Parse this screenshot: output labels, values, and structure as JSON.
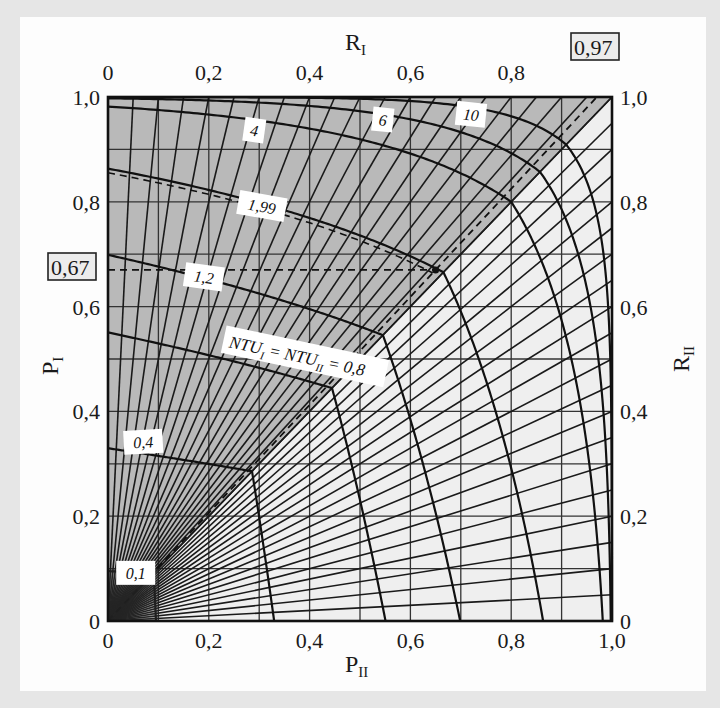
{
  "chart_data": {
    "type": "line",
    "title": "",
    "plot_kind": "P-NTU-R diagram (counterflow), symmetric representation",
    "xlabel": "P_II",
    "ylabel": "P_I",
    "top_xlabel": "R_I",
    "right_ylabel": "R_II",
    "xlim": [
      0,
      1.0
    ],
    "ylim": [
      0,
      1.0
    ],
    "grid": true,
    "grid_step": 0.1,
    "x_ticks": [
      "0",
      "0,2",
      "0,4",
      "0,6",
      "0,8",
      "1,0"
    ],
    "y_ticks": [
      "0",
      "0,2",
      "0,4",
      "0,6",
      "0,8",
      "1,0"
    ],
    "top_ticks": [
      "0",
      "0,2",
      "0,4",
      "0,6",
      "0,8"
    ],
    "right_ticks": [
      "0",
      "0,2",
      "0,4",
      "0,6",
      "0,8",
      "1,0"
    ],
    "highlighted_values": {
      "R_I": "0,97",
      "P_I": "0,67"
    },
    "R_lines": [
      0,
      0.05,
      0.1,
      0.15,
      0.2,
      0.25,
      0.3,
      0.35,
      0.4,
      0.45,
      0.5,
      0.55,
      0.6,
      0.65,
      0.7,
      0.75,
      0.8,
      0.85,
      0.9,
      0.95,
      1.0
    ],
    "ntu_curves": [
      0.1,
      0.4,
      0.8,
      1.2,
      1.99,
      4,
      6,
      10
    ],
    "ntu_labels": [
      {
        "ntu": 0.1,
        "text": "0,1",
        "x": 0.055,
        "y": 0.09,
        "rot": 0
      },
      {
        "ntu": 0.4,
        "text": "0,4",
        "x": 0.07,
        "y": 0.34,
        "rot": -3
      },
      {
        "ntu": 0.8,
        "text": "NTU_I = NTU_II = 0,8",
        "x": 0.24,
        "y": 0.53,
        "rot": 12
      },
      {
        "ntu": 1.2,
        "text": "1,2",
        "x": 0.19,
        "y": 0.655,
        "rot": 8
      },
      {
        "ntu": 1.99,
        "text": "1,99",
        "x": 0.305,
        "y": 0.79,
        "rot": 10
      },
      {
        "ntu": 4,
        "text": "4",
        "x": 0.29,
        "y": 0.935,
        "rot": 8
      },
      {
        "ntu": 6,
        "text": "6",
        "x": 0.545,
        "y": 0.955,
        "rot": 6
      },
      {
        "ntu": 10,
        "text": "10",
        "x": 0.72,
        "y": 0.965,
        "rot": 6
      }
    ],
    "operating_point": {
      "P_II": 0.65,
      "P_I": 0.67,
      "R_I": 0.97,
      "NTU_I": 1.99
    },
    "shading": {
      "upper_left_triangle": "#b9b9b9",
      "lower_right_triangle": "#efefef"
    }
  },
  "labels": {
    "x_axis": "P",
    "x_axis_sub": "II",
    "y_axis": "P",
    "y_axis_sub": "I",
    "top_axis": "R",
    "top_axis_sub": "I",
    "right_axis": "R",
    "right_axis_sub": "II",
    "boxed_top": "0,97",
    "boxed_left": "0,67",
    "ntu_prefix": "NTU",
    "ntu_eq": "=",
    "ntu_value": "= 0,8"
  }
}
